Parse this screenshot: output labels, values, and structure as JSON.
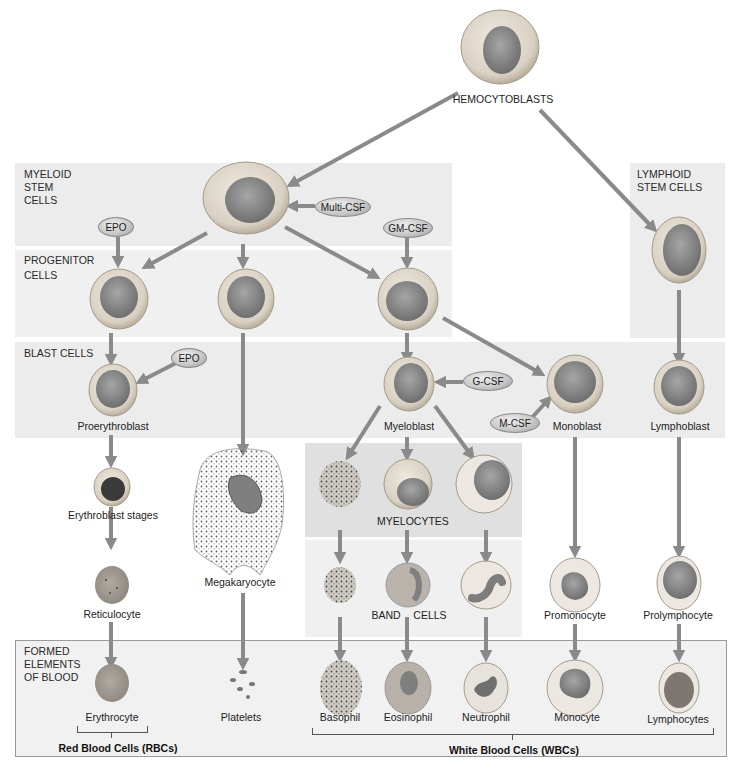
{
  "diagram": {
    "title_node": "HEMOCYTOBLASTS",
    "colors": {
      "arrow": "#8a8a8a",
      "panel": "#ececec",
      "cell_cytoplasm": "#d8d2c8",
      "cell_nucleus": "#8f8f8f",
      "factor_fill": "#c9c9c9"
    },
    "sections": {
      "myeloid_stem": "MYELOID\nSTEM\nCELLS",
      "lymphoid_stem": "LYMPHOID\nSTEM CELLS",
      "progenitor": "PROGENITOR\nCELLS",
      "blast": "BLAST CELLS",
      "formed_elements": "FORMED\nELEMENTS\nOF BLOOD"
    },
    "growth_factors": {
      "multi_csf": "Multi-CSF",
      "gm_csf": "GM-CSF",
      "epo_progenitor": "EPO",
      "epo_blast": "EPO",
      "g_csf": "G-CSF",
      "m_csf": "M-CSF"
    },
    "cells": {
      "proerythroblast": "Proerythroblast",
      "erythroblast": "Erythroblast stages",
      "reticulocyte": "Reticulocyte",
      "erythrocyte": "Erythrocyte",
      "megakaryocyte": "Megakaryocyte",
      "platelets": "Platelets",
      "myeloblast": "Myeloblast",
      "myelocytes": "MYELOCYTES",
      "band_cells_left": "BAND",
      "band_cells_right": "CELLS",
      "basophil": "Basophil",
      "eosinophil": "Eosinophil",
      "neutrophil": "Neutrophil",
      "monoblast": "Monoblast",
      "promonocyte": "Promonocyte",
      "monocyte": "Monocyte",
      "lymphoblast": "Lymphoblast",
      "prolymphocyte": "Prolymphocyte",
      "lymphocytes": "Lymphocytes"
    },
    "groups": {
      "rbc": "Red Blood Cells (RBCs)",
      "wbc": "White Blood Cells (WBCs)"
    }
  }
}
